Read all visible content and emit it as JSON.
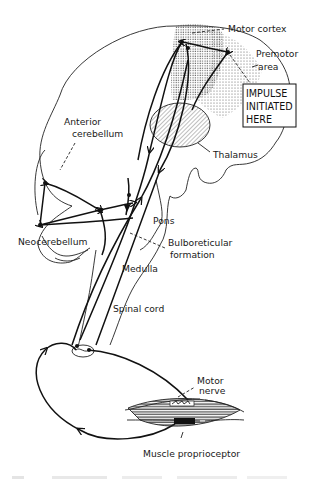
{
  "figure": {
    "labels": {
      "motor_cortex": "Motor cortex",
      "premotor_line1": "Premotor",
      "premotor_line2": "area",
      "impulse_line1": "IMPULSE",
      "impulse_line2": "INITIATED",
      "impulse_line3": "HERE",
      "anterior_line1": "Anterior",
      "anterior_line2": "cerebellum",
      "thalamus": "Thalamus",
      "pons": "Pons",
      "neocerebellum": "Neocerebellum",
      "bulbo_line1": "Bulboreticular",
      "bulbo_line2": "formation",
      "medulla": "Medulla",
      "spinal_cord": "Spinal cord",
      "motor_nerve_line1": "Motor",
      "motor_nerve_line2": "nerve",
      "muscle_proprioceptor": "Muscle proprioceptor"
    },
    "colors": {
      "ink": "#111111",
      "background": "#ffffff"
    }
  }
}
